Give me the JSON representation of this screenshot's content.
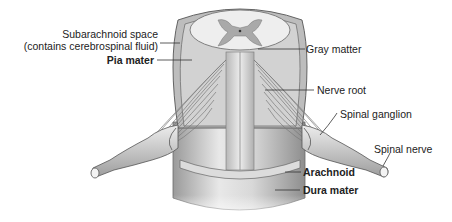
{
  "diagram": {
    "labels": {
      "subarachnoid_line1": "Subarachnoid space",
      "subarachnoid_line2": "(contains cerebrospinal fluid)",
      "pia_mater": "Pia mater",
      "gray_matter": "Gray matter",
      "nerve_root": "Nerve root",
      "spinal_ganglion": "Spinal ganglion",
      "spinal_nerve": "Spinal nerve",
      "arachnoid": "Arachnoid",
      "dura_mater": "Dura mater"
    },
    "bold_labels": [
      "Pia mater",
      "Arachnoid",
      "Dura mater"
    ],
    "colors": {
      "background": "#ffffff",
      "tissue_light": "#e6e6e6",
      "tissue_mid": "#c4c4c4",
      "tissue_dark": "#8a8a8a",
      "outline": "#555555",
      "gray_matter": "#a9a9a9",
      "leader_line": "#333333"
    }
  }
}
